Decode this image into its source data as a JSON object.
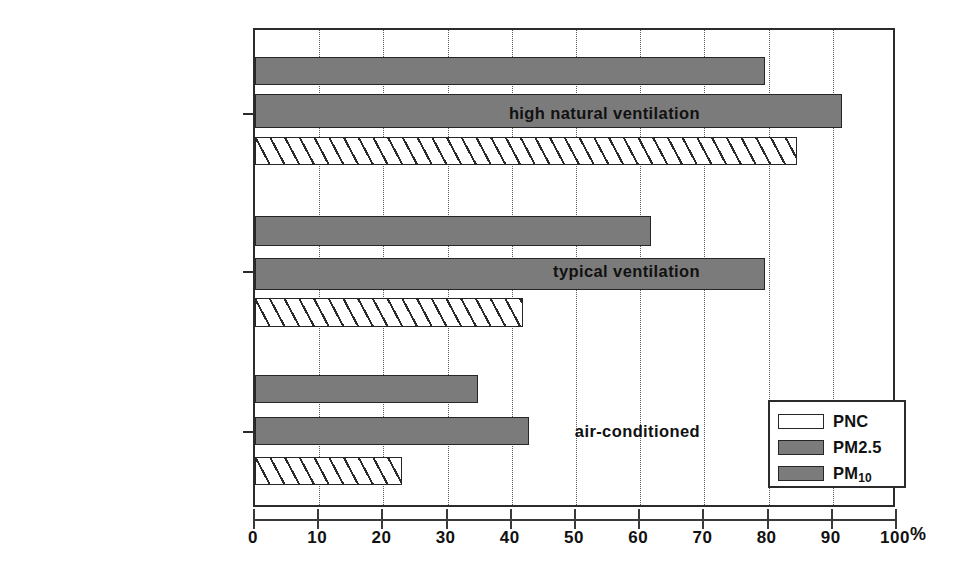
{
  "chart_data": {
    "type": "bar",
    "orientation": "horizontal",
    "title": "",
    "xlabel": "%",
    "ylabel": "",
    "xlim": [
      0,
      100
    ],
    "xticks": [
      0,
      10,
      20,
      30,
      40,
      50,
      60,
      70,
      80,
      90,
      100
    ],
    "xtick_labels": [
      "0",
      "10",
      "20",
      "30",
      "40",
      "50",
      "60",
      "70",
      "80",
      "90",
      "100"
    ],
    "grid": "vertical-dotted",
    "legend_position": "lower-right",
    "categories": [
      "high natural ventilation",
      "typical ventilation",
      "air-conditioned"
    ],
    "series": [
      {
        "name": "PNC",
        "style": "hatched",
        "color": "#ffffff",
        "values": [
          85,
          42,
          23
        ]
      },
      {
        "name": "PM2.5",
        "style": "solid",
        "color": "#7b7b7b",
        "values": [
          92,
          80,
          43
        ]
      },
      {
        "name": "PM10",
        "style": "solid",
        "color": "#7b7b7b",
        "values": [
          80,
          62,
          35
        ]
      }
    ]
  },
  "axis": {
    "unit_label": "%",
    "tick_0": "0",
    "tick_10": "10",
    "tick_20": "20",
    "tick_30": "30",
    "tick_40": "40",
    "tick_50": "50",
    "tick_60": "60",
    "tick_70": "70",
    "tick_80": "80",
    "tick_90": "90",
    "tick_100": "100"
  },
  "categories": {
    "cat_0": "high natural ventilation",
    "cat_1": "typical ventilation",
    "cat_2": "air-conditioned"
  },
  "legend": {
    "items": [
      {
        "label": "PNC",
        "label_main": "PNC",
        "label_sub": ""
      },
      {
        "label": "PM2.5",
        "label_main": "PM2.5",
        "label_sub": ""
      },
      {
        "label": "PM10",
        "label_main": "PM",
        "label_sub": "10"
      }
    ]
  }
}
